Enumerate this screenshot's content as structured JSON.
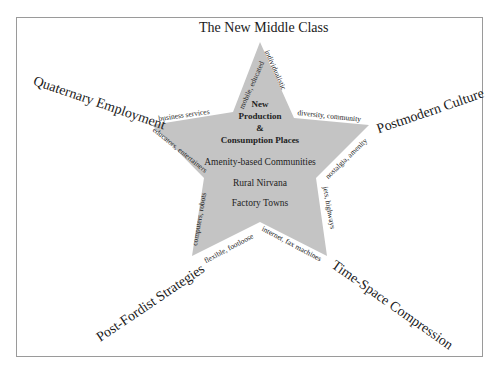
{
  "diagram": {
    "type": "star-concept-map",
    "colors": {
      "star_fill": "#c4c4c4",
      "frame_border": "#9a9a9a",
      "text": "#222222"
    },
    "axes": {
      "top": "The New Middle Class",
      "upper_left": "Quaternary Employment",
      "upper_right": "Postmodern Culture",
      "lower_left": "Post-Fordist Strategies",
      "lower_right": "Time-Space Compression"
    },
    "edge_labels": {
      "top_left": "mobile, educated",
      "top_right": "individualistic",
      "left_top": "business services",
      "left_bottom": "educators, entertainers",
      "right_top": "diversity, community",
      "right_bottom": "nostalgia, amenity",
      "bottom_left_side": "computers, robots",
      "bottom_left_base": "flexible, footloose",
      "bottom_right_base": "internet, fax machines",
      "bottom_right_side": "jets, highways"
    },
    "center": {
      "title_lines": [
        "New",
        "Production",
        "&",
        "Consumption Places"
      ],
      "items": [
        "Amenity-based Communities",
        "Rural Nirvana",
        "Factory Towns"
      ]
    }
  }
}
